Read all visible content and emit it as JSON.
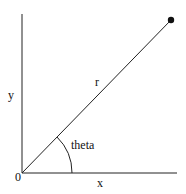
{
  "diagram": {
    "type": "polar-coordinates",
    "labels": {
      "y_axis": "y",
      "x_axis": "x",
      "radius": "r",
      "angle": "theta",
      "origin": "0"
    },
    "colors": {
      "line": "#222222",
      "point": "#111111",
      "background": "#ffffff"
    }
  }
}
